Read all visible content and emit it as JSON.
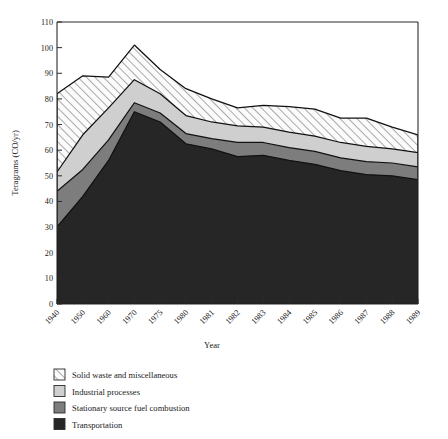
{
  "chart_data": {
    "type": "area",
    "title": "",
    "xlabel": "Year",
    "ylabel": "Teragrams (CO/yr)",
    "ylim": [
      0,
      110
    ],
    "ytick_step": 10,
    "yticks": [
      0,
      10,
      20,
      30,
      40,
      50,
      60,
      70,
      80,
      90,
      100,
      110
    ],
    "grid": false,
    "stacked": true,
    "legend_position": "below-plot",
    "categories": [
      "1940",
      "1950",
      "1960",
      "1970",
      "1975",
      "1980",
      "1981",
      "1982",
      "1983",
      "1984",
      "1985",
      "1986",
      "1987",
      "1988",
      "1989"
    ],
    "series": [
      {
        "name": "Transportation",
        "fill": "#262626",
        "hatch": "none",
        "values": [
          30.0,
          42.0,
          56.0,
          75.0,
          71.0,
          62.5,
          60.5,
          57.5,
          58.0,
          56.0,
          54.5,
          52.0,
          50.5,
          50.0,
          48.5
        ]
      },
      {
        "name": "Stationary source fuel combustion",
        "fill": "#7d7d7d",
        "hatch": "none",
        "values": [
          14.0,
          10.5,
          8.0,
          3.5,
          3.5,
          4.0,
          4.0,
          5.5,
          5.0,
          5.0,
          5.0,
          5.0,
          5.0,
          5.0,
          5.0
        ]
      },
      {
        "name": "Industrial processes",
        "fill": "#cfcfcf",
        "hatch": "none",
        "values": [
          7.5,
          13.5,
          12.5,
          9.0,
          7.5,
          7.0,
          6.5,
          6.5,
          6.0,
          6.0,
          6.0,
          6.0,
          6.0,
          5.5,
          5.5
        ]
      },
      {
        "name": "Solid waste and miscellaneous",
        "fill": "#f2f2f2",
        "hatch": "diagonal",
        "values": [
          30.5,
          23.0,
          12.0,
          13.5,
          9.5,
          10.5,
          9.0,
          7.0,
          8.5,
          10.0,
          10.5,
          9.5,
          11.0,
          8.5,
          7.0
        ]
      }
    ],
    "cumulative_totals": [
      82.0,
      89.0,
      88.5,
      101.0,
      91.5,
      84.0,
      80.0,
      76.5,
      77.5,
      77.0,
      76.0,
      72.5,
      72.5,
      69.0,
      66.0
    ],
    "annotations": []
  },
  "legend": {
    "items": [
      {
        "label": "Solid waste and miscellaneous",
        "swatch": "hatch-diagonal",
        "color": "#f2f2f2"
      },
      {
        "label": "Industrial processes",
        "swatch": "solid",
        "color": "#cfcfcf"
      },
      {
        "label": "Stationary source fuel combustion",
        "swatch": "solid",
        "color": "#7d7d7d"
      },
      {
        "label": "Transportation",
        "swatch": "solid",
        "color": "#262626"
      }
    ]
  },
  "axes": {
    "ylabel": "Teragrams (CO/yr)",
    "xlabel": "Year"
  }
}
